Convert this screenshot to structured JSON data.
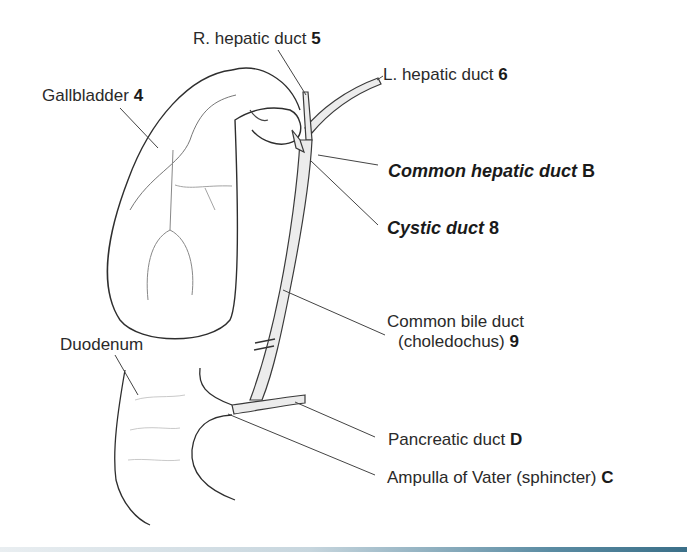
{
  "figure": {
    "labels": [
      {
        "id": "r-hepatic-duct",
        "text": "R. hepatic duct ",
        "key": "5",
        "style": "normal"
      },
      {
        "id": "l-hepatic-duct",
        "text": "L. hepatic duct ",
        "key": "6",
        "style": "normal"
      },
      {
        "id": "gallbladder",
        "text": "Gallbladder ",
        "key": "4",
        "style": "normal"
      },
      {
        "id": "common-hepatic-duct",
        "text": "Common  hepatic duct ",
        "key": "B",
        "style": "bold-italic"
      },
      {
        "id": "cystic-duct",
        "text": "Cystic duct ",
        "key": "8",
        "style": "bold-italic"
      },
      {
        "id": "common-bile-duct",
        "text": "Common bile duct",
        "text2": "(choledochus) ",
        "key": "9",
        "style": "normal"
      },
      {
        "id": "duodenum",
        "text": "Duodenum",
        "key": "",
        "style": "normal"
      },
      {
        "id": "pancreatic-duct",
        "text": "Pancreatic duct ",
        "key": "D",
        "style": "normal"
      },
      {
        "id": "ampulla-of-vater",
        "text": "Ampulla of Vater (sphincter) ",
        "key": "C",
        "style": "normal"
      }
    ]
  },
  "colors": {
    "line": "#333333",
    "duct_fill": "#e6e6e6",
    "leader": "#444444",
    "accent_bar": "#3a6f88"
  }
}
